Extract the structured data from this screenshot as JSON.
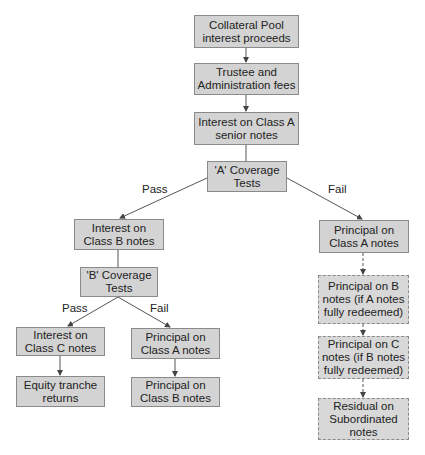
{
  "nodes": {
    "collateral": "Collateral Pool\ninterest proceeds",
    "trustee": "Trustee and\nAdministration fees",
    "interest_a": "Interest on Class A\nsenior notes",
    "coverage_a": "'A' Coverage\nTests",
    "interest_b": "Interest on\nClass B notes",
    "coverage_b": "'B' Coverage\nTests",
    "interest_c": "Interest on\nClass C notes",
    "equity": "Equity tranche\nreturns",
    "principal_a_mid": "Principal on\nClass A notes",
    "principal_b_mid": "Principal on\nClass B notes",
    "principal_a_right": "Principal on\nClass A notes",
    "principal_b_right": "Principal on B\nnotes (if A notes\nfully redeemed)",
    "principal_c_right": "Principal on C\nnotes (if B notes\nfully redeemed)",
    "residual": "Residual on\nSubordinated\nnotes"
  },
  "edge_labels": {
    "a_pass": "Pass",
    "a_fail": "Fail",
    "b_pass": "Pass",
    "b_fail": "Fail"
  },
  "colors": {
    "box_fill": "#d3d3d3",
    "box_border": "#8a8a8a",
    "line": "#555555"
  }
}
